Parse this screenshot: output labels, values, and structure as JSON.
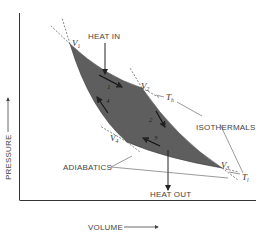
{
  "diagram": {
    "type": "carnot-cycle-pv",
    "axes": {
      "x_label": "VOLUME",
      "y_label": "PRESSURE"
    },
    "labels": {
      "heat_in": "HEAT IN",
      "heat_out": "HEAT OUT",
      "isothermals": "ISOTHERMALS",
      "adiabatics": "ADIABATICS"
    },
    "states": [
      {
        "id": "V1",
        "letter": "V",
        "sub": "1"
      },
      {
        "id": "V2",
        "letter": "V",
        "sub": "2"
      },
      {
        "id": "V3",
        "letter": "V",
        "sub": "3"
      },
      {
        "id": "V4",
        "letter": "V",
        "sub": "4"
      }
    ],
    "temperatures": [
      {
        "id": "Th",
        "letter": "T",
        "sub": "h"
      },
      {
        "id": "Tl",
        "letter": "T",
        "sub": "l"
      }
    ],
    "steps": [
      "1",
      "2",
      "3",
      "4"
    ],
    "colors": {
      "cycle_fill": "#5e5e5e",
      "line": "#444444",
      "text": "#444444",
      "background": "#ffffff"
    }
  }
}
